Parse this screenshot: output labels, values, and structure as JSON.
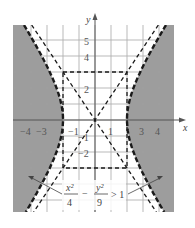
{
  "chart_data": {
    "type": "inequality-region",
    "title": "",
    "xlabel": "x",
    "ylabel": "y",
    "xlim": [
      -5,
      5
    ],
    "ylim": [
      -5.75,
      5.95
    ],
    "grid": true,
    "x_ticks": [
      "−4",
      "−3",
      "−1",
      "1",
      "3",
      "4"
    ],
    "x_tick_values": [
      -4,
      -3,
      -1,
      1,
      3,
      4
    ],
    "y_ticks": [
      "5",
      "4",
      "2",
      "−1",
      "−2"
    ],
    "y_tick_values": [
      5,
      4,
      2,
      -1,
      -2
    ],
    "inequality": {
      "lhs_term1_num": "x²",
      "lhs_term1_den": "4",
      "minus": "−",
      "lhs_term2_num": "y²",
      "lhs_term2_den": "9",
      "rhs": "> 1"
    },
    "hyperbola": {
      "a": 2,
      "b": 3,
      "boundary_style": "dashed",
      "shaded": "outside branches (|x| side)"
    },
    "asymptotes": [
      {
        "equation": "y = 1.5x",
        "style": "dashed"
      },
      {
        "equation": "y = -1.5x",
        "style": "dashed"
      }
    ],
    "fundamental_rectangle": {
      "x": [
        -2,
        2
      ],
      "y": [
        -3,
        3
      ],
      "style": "dashed"
    },
    "colors": {
      "shade": "#8c8c8c",
      "grid": "#cfcfcf",
      "axis": "#555555",
      "curve": "#1a1a1a"
    }
  }
}
